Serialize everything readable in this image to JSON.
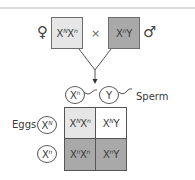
{
  "cross": {
    "female_symbol": "♀",
    "male_symbol": "♂",
    "cross_symbol": "×",
    "female_genotype": {
      "base1": "X",
      "sup1": "N",
      "base2": "X",
      "sup2": "n"
    },
    "male_genotype": {
      "base1": "X",
      "sup1": "n",
      "base2": "Y",
      "sup2": ""
    }
  },
  "gametes": {
    "sperm_label": "Sperm",
    "eggs_label": "Eggs",
    "sperm": [
      {
        "base": "X",
        "sup": "n"
      },
      {
        "base": "Y",
        "sup": ""
      }
    ],
    "eggs": [
      {
        "base": "X",
        "sup": "N"
      },
      {
        "base": "X",
        "sup": "n"
      }
    ]
  },
  "punnett": {
    "cells": [
      [
        {
          "base1": "X",
          "sup1": "N",
          "base2": "X",
          "sup2": "n",
          "fill": "#e6e6e6"
        },
        {
          "base1": "X",
          "sup1": "N",
          "base2": "Y",
          "sup2": "",
          "fill": "#ffffff"
        }
      ],
      [
        {
          "base1": "X",
          "sup1": "n",
          "base2": "X",
          "sup2": "n",
          "fill": "#a9a9a9"
        },
        {
          "base1": "X",
          "sup1": "n",
          "base2": "Y",
          "sup2": "",
          "fill": "#a9a9a9"
        }
      ]
    ]
  },
  "colors": {
    "female_box": "#e6e6e6",
    "male_box": "#a9a9a9",
    "stroke": "#555555"
  }
}
